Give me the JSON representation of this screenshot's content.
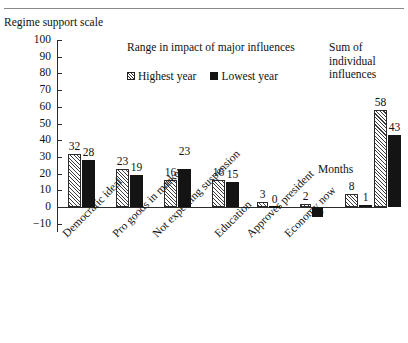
{
  "figure": {
    "caption_stub": "",
    "y_axis_caption": "Regime support scale",
    "months_note": "Months"
  },
  "chart_data": {
    "type": "bar",
    "title": "Range in impact of major influences",
    "xlabel": "",
    "ylabel": "Regime support scale",
    "ylim": [
      -10,
      100
    ],
    "yticks": [
      100,
      90,
      80,
      70,
      60,
      50,
      40,
      30,
      20,
      10,
      0,
      -10
    ],
    "ytick_labels": [
      "100",
      "90",
      "80",
      "70",
      "60",
      "50",
      "40",
      "30",
      "20",
      "10",
      "0",
      "-10"
    ],
    "grid": false,
    "legend_position": "top-center",
    "annotations": [
      "Sum of individual influences",
      "Months"
    ],
    "categories": [
      "Democratic ideal",
      "Pro goods in market",
      "Not expecting suspension",
      "Education",
      "Approves president",
      "Economy now",
      "Months",
      "Sum of individual influences"
    ],
    "series": [
      {
        "name": "Highest year",
        "pattern": "hatched",
        "values": [
          32,
          23,
          16,
          16,
          3,
          2,
          8,
          58
        ]
      },
      {
        "name": "Lowest year",
        "pattern": "solid-black",
        "values": [
          28,
          19,
          23,
          15,
          0,
          -6,
          1,
          43
        ]
      }
    ]
  },
  "legend": {
    "items": [
      {
        "label": "Highest year",
        "marker": "hatched-square"
      },
      {
        "label": "Lowest year",
        "marker": "filled-square"
      }
    ]
  }
}
